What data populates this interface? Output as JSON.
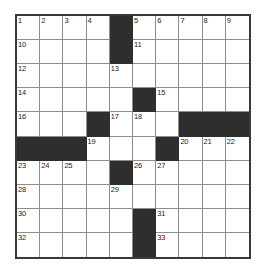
{
  "puzzle": {
    "type": "crossword-grid",
    "rows": 10,
    "columns": 10,
    "colors": {
      "block": "#2e2e2e",
      "cell": "#ffffff",
      "grid_line": "#8d8d8d",
      "frame": "#3a3a3a",
      "number": "#1b1b1b"
    },
    "grid": [
      [
        {
          "block": false,
          "number": "1"
        },
        {
          "block": false,
          "number": "2"
        },
        {
          "block": false,
          "number": "3"
        },
        {
          "block": false,
          "number": "4"
        },
        {
          "block": true,
          "number": ""
        },
        {
          "block": false,
          "number": "5"
        },
        {
          "block": false,
          "number": "6"
        },
        {
          "block": false,
          "number": "7"
        },
        {
          "block": false,
          "number": "8"
        },
        {
          "block": false,
          "number": "9"
        }
      ],
      [
        {
          "block": false,
          "number": "10"
        },
        {
          "block": false,
          "number": ""
        },
        {
          "block": false,
          "number": ""
        },
        {
          "block": false,
          "number": ""
        },
        {
          "block": true,
          "number": ""
        },
        {
          "block": false,
          "number": "11"
        },
        {
          "block": false,
          "number": ""
        },
        {
          "block": false,
          "number": ""
        },
        {
          "block": false,
          "number": ""
        },
        {
          "block": false,
          "number": ""
        }
      ],
      [
        {
          "block": false,
          "number": "12"
        },
        {
          "block": false,
          "number": ""
        },
        {
          "block": false,
          "number": ""
        },
        {
          "block": false,
          "number": ""
        },
        {
          "block": false,
          "number": "13"
        },
        {
          "block": false,
          "number": ""
        },
        {
          "block": false,
          "number": ""
        },
        {
          "block": false,
          "number": ""
        },
        {
          "block": false,
          "number": ""
        },
        {
          "block": false,
          "number": ""
        }
      ],
      [
        {
          "block": false,
          "number": "14"
        },
        {
          "block": false,
          "number": ""
        },
        {
          "block": false,
          "number": ""
        },
        {
          "block": false,
          "number": ""
        },
        {
          "block": false,
          "number": ""
        },
        {
          "block": true,
          "number": ""
        },
        {
          "block": false,
          "number": "15"
        },
        {
          "block": false,
          "number": ""
        },
        {
          "block": false,
          "number": ""
        },
        {
          "block": false,
          "number": ""
        }
      ],
      [
        {
          "block": false,
          "number": "16"
        },
        {
          "block": false,
          "number": ""
        },
        {
          "block": false,
          "number": ""
        },
        {
          "block": true,
          "number": ""
        },
        {
          "block": false,
          "number": "17"
        },
        {
          "block": false,
          "number": "18"
        },
        {
          "block": false,
          "number": ""
        },
        {
          "block": true,
          "number": ""
        },
        {
          "block": true,
          "number": ""
        },
        {
          "block": true,
          "number": ""
        }
      ],
      [
        {
          "block": true,
          "number": ""
        },
        {
          "block": true,
          "number": ""
        },
        {
          "block": true,
          "number": ""
        },
        {
          "block": false,
          "number": "19"
        },
        {
          "block": false,
          "number": ""
        },
        {
          "block": false,
          "number": ""
        },
        {
          "block": true,
          "number": ""
        },
        {
          "block": false,
          "number": "20"
        },
        {
          "block": false,
          "number": "21"
        },
        {
          "block": false,
          "number": "22"
        }
      ],
      [
        {
          "block": false,
          "number": "23"
        },
        {
          "block": false,
          "number": "24"
        },
        {
          "block": false,
          "number": "25"
        },
        {
          "block": false,
          "number": ""
        },
        {
          "block": true,
          "number": ""
        },
        {
          "block": false,
          "number": "26"
        },
        {
          "block": false,
          "number": "27"
        },
        {
          "block": false,
          "number": ""
        },
        {
          "block": false,
          "number": ""
        },
        {
          "block": false,
          "number": ""
        }
      ],
      [
        {
          "block": false,
          "number": "28"
        },
        {
          "block": false,
          "number": ""
        },
        {
          "block": false,
          "number": ""
        },
        {
          "block": false,
          "number": ""
        },
        {
          "block": false,
          "number": "29"
        },
        {
          "block": false,
          "number": ""
        },
        {
          "block": false,
          "number": ""
        },
        {
          "block": false,
          "number": ""
        },
        {
          "block": false,
          "number": ""
        },
        {
          "block": false,
          "number": ""
        }
      ],
      [
        {
          "block": false,
          "number": "30"
        },
        {
          "block": false,
          "number": ""
        },
        {
          "block": false,
          "number": ""
        },
        {
          "block": false,
          "number": ""
        },
        {
          "block": false,
          "number": ""
        },
        {
          "block": true,
          "number": ""
        },
        {
          "block": false,
          "number": "31"
        },
        {
          "block": false,
          "number": ""
        },
        {
          "block": false,
          "number": ""
        },
        {
          "block": false,
          "number": ""
        }
      ],
      [
        {
          "block": false,
          "number": "32"
        },
        {
          "block": false,
          "number": ""
        },
        {
          "block": false,
          "number": ""
        },
        {
          "block": false,
          "number": ""
        },
        {
          "block": false,
          "number": ""
        },
        {
          "block": true,
          "number": ""
        },
        {
          "block": false,
          "number": "33"
        },
        {
          "block": false,
          "number": ""
        },
        {
          "block": false,
          "number": ""
        },
        {
          "block": false,
          "number": ""
        }
      ]
    ]
  }
}
